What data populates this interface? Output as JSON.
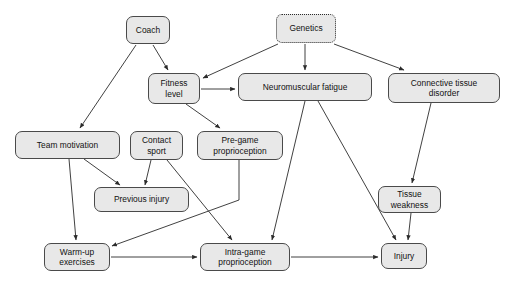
{
  "diagram": {
    "background_color": "#ffffff",
    "node_fill": "#e8e8e8",
    "node_stroke": "#4a4a4a",
    "edge_color": "#2b2b2b",
    "nodes": [
      {
        "id": "coach",
        "label": "Coach",
        "style": "solid",
        "x": 126,
        "y": 16,
        "w": 44,
        "h": 28
      },
      {
        "id": "genetics",
        "label": "Genetics",
        "style": "dotted",
        "x": 276,
        "y": 14,
        "w": 60,
        "h": 29
      },
      {
        "id": "fitness",
        "label": "Fitness\nlevel",
        "style": "solid",
        "x": 148,
        "y": 73,
        "w": 52,
        "h": 31
      },
      {
        "id": "neuro",
        "label": "Neuromuscular fatigue",
        "style": "solid",
        "x": 238,
        "y": 73,
        "w": 134,
        "h": 28
      },
      {
        "id": "connective",
        "label": "Connective tissue\ndisorder",
        "style": "solid",
        "x": 388,
        "y": 73,
        "w": 112,
        "h": 30
      },
      {
        "id": "teammot",
        "label": "Team motivation",
        "style": "solid",
        "x": 15,
        "y": 131,
        "w": 105,
        "h": 28
      },
      {
        "id": "contact",
        "label": "Contact\nsport",
        "style": "solid",
        "x": 130,
        "y": 131,
        "w": 53,
        "h": 29
      },
      {
        "id": "pregame",
        "label": "Pre-game\nproprioception",
        "style": "solid",
        "x": 197,
        "y": 131,
        "w": 86,
        "h": 29
      },
      {
        "id": "previnj",
        "label": "Previous injury",
        "style": "solid",
        "x": 94,
        "y": 187,
        "w": 95,
        "h": 25
      },
      {
        "id": "tissueweak",
        "label": "Tissue\nweakness",
        "style": "solid",
        "x": 378,
        "y": 186,
        "w": 63,
        "h": 27
      },
      {
        "id": "warmup",
        "label": "Warm-up\nexercises",
        "style": "solid",
        "x": 44,
        "y": 243,
        "w": 66,
        "h": 28
      },
      {
        "id": "intragame",
        "label": "Intra-game\nproprioception",
        "style": "solid",
        "x": 200,
        "y": 243,
        "w": 90,
        "h": 28
      },
      {
        "id": "injury",
        "label": "Injury",
        "style": "solid",
        "x": 381,
        "y": 243,
        "w": 46,
        "h": 26
      }
    ],
    "edges": [
      {
        "id": "coach-fitness",
        "from": "coach",
        "to": "fitness",
        "path": "M 153 45 L 168 70"
      },
      {
        "id": "coach-teammotivation",
        "from": "coach",
        "to": "teammot",
        "path": "M 136 45 L 80 128"
      },
      {
        "id": "genetics-fitness",
        "from": "genetics",
        "to": "fitness",
        "path": "M 278 44 L 203 78"
      },
      {
        "id": "genetics-neuro",
        "from": "genetics",
        "to": "neuro",
        "path": "M 305 44 L 305 70"
      },
      {
        "id": "genetics-connective",
        "from": "genetics",
        "to": "connective",
        "path": "M 334 44 L 404 70"
      },
      {
        "id": "fitness-neuro",
        "from": "fitness",
        "to": "neuro",
        "path": "M 201 89 L 235 89"
      },
      {
        "id": "fitness-pregame",
        "from": "fitness",
        "to": "pregame",
        "path": "M 186 104 L 220 128"
      },
      {
        "id": "teammotivation-previnj",
        "from": "teammot",
        "to": "previnj",
        "path": "M 84 159 L 120 185"
      },
      {
        "id": "teammotivation-warmup",
        "from": "teammot",
        "to": "warmup",
        "path": "M 69 159 L 76 240"
      },
      {
        "id": "contact-previnj",
        "from": "contact",
        "to": "previnj",
        "path": "M 151 160 L 145 185"
      },
      {
        "id": "contact-intragame",
        "from": "contact",
        "to": "intragame",
        "path": "M 167 160 L 232 240"
      },
      {
        "id": "pregame-warmup",
        "from": "pregame",
        "to": "warmup",
        "path": "M 239 160 L 239 200 L 112 246"
      },
      {
        "id": "neuro-intragame",
        "from": "neuro",
        "to": "intragame",
        "path": "M 305 101 L 272 240"
      },
      {
        "id": "neuro-injury",
        "from": "neuro",
        "to": "injury",
        "path": "M 318 101 L 396 240"
      },
      {
        "id": "connective-tissueweak",
        "from": "connective",
        "to": "tissueweak",
        "path": "M 431 103 L 412 183"
      },
      {
        "id": "tissueweak-injury",
        "from": "tissueweak",
        "to": "injury",
        "path": "M 411 213 L 408 240"
      },
      {
        "id": "warmup-intragame",
        "from": "warmup",
        "to": "intragame",
        "path": "M 111 257 L 197 257"
      },
      {
        "id": "intragame-injury",
        "from": "intragame",
        "to": "injury",
        "path": "M 291 257 L 378 257"
      }
    ]
  }
}
